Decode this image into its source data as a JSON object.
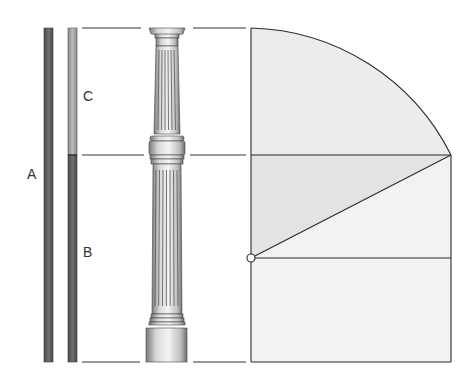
{
  "labels": {
    "a": "A",
    "b": "B",
    "c": "C"
  },
  "colors": {
    "bar_dark": "#5a5a5a",
    "bar_light": "#a8a8a8",
    "line": "#2a2a2a",
    "fill_dark": "#e2e2e2",
    "fill_light": "#f1f1f1",
    "column_fill": "#e9e9e9",
    "column_shade": "#8a8a8a"
  },
  "geometry": {
    "top_y": 28,
    "division_y": 155,
    "bottom_y": 362,
    "construction_y": 258,
    "rect_left": 251,
    "rect_right": 451
  },
  "elements": [
    {
      "name": "segment-A",
      "label": "A",
      "desc": "full height bar"
    },
    {
      "name": "segment-C",
      "label": "C",
      "desc": "upper minor part"
    },
    {
      "name": "segment-B",
      "label": "B",
      "desc": "lower major part"
    },
    {
      "name": "fluted-column",
      "desc": "column with capital, ring band and base"
    },
    {
      "name": "construction",
      "desc": "quarter-arc and diagonal golden-section construction"
    }
  ]
}
